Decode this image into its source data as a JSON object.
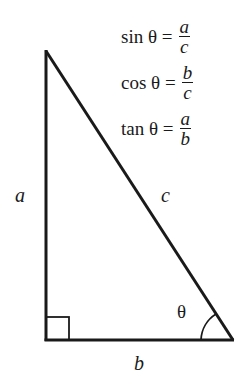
{
  "formulas": [
    {
      "lhs": "sin θ =",
      "numerator": "a",
      "denominator": "c"
    },
    {
      "lhs": "cos θ =",
      "numerator": "b",
      "denominator": "c"
    },
    {
      "lhs": "tan θ =",
      "numerator": "a",
      "denominator": "b"
    }
  ],
  "triangle": {
    "side_labels": {
      "vertical": "a",
      "hypotenuse": "c",
      "base": "b"
    },
    "angle_label": "θ",
    "right_angle_marker": true,
    "stroke_color": "#1a1a1a"
  }
}
